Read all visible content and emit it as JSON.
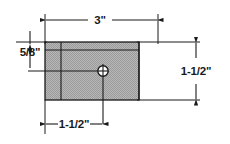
{
  "drawing": {
    "title": "Rectangular plate with located hole",
    "units": "inches",
    "background_color": "#ffffff",
    "line_color": "#1a1a1a",
    "hatch_fill_color": "#b0b0b0",
    "plate": {
      "fill": "#b0b0b0",
      "outline": "#1a1a1a"
    },
    "hole": {
      "name": "drilled-hole",
      "fill": "#ffffff",
      "outline": "#1a1a1a"
    },
    "dimensions": {
      "width_top": "3\"",
      "edge_distance_left": "5/8\"",
      "height_right": "1-1/2\"",
      "hole_offset_bottom": "1-1/2\""
    }
  }
}
